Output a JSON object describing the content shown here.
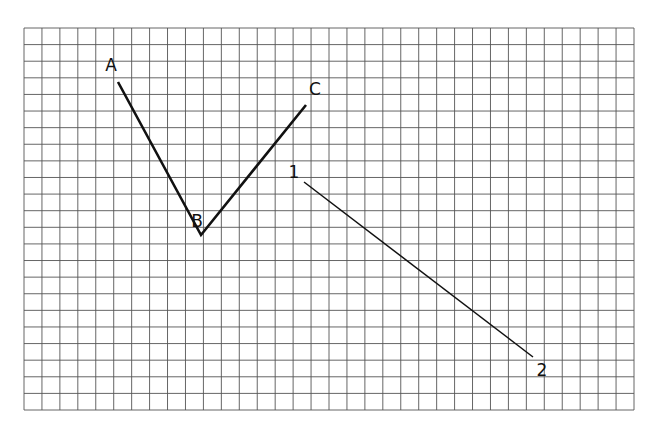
{
  "grid": {
    "x0": 24,
    "y0": 28,
    "x1": 634,
    "y1": 410,
    "cols": 34,
    "rows": 23,
    "line_color": "#555555",
    "background": "#ffffff"
  },
  "polylines": [
    {
      "id": "ABC",
      "points": [
        [
          118,
          82
        ],
        [
          201,
          235
        ],
        [
          306,
          105
        ]
      ],
      "stroke": "#111111",
      "width": 2.6
    },
    {
      "id": "12",
      "points": [
        [
          304,
          182
        ],
        [
          533,
          357
        ]
      ],
      "stroke": "#111111",
      "width": 1.5
    }
  ],
  "labels": [
    {
      "id": "A",
      "text": "A",
      "x": 111,
      "y": 71
    },
    {
      "id": "B",
      "text": "B",
      "x": 197,
      "y": 227
    },
    {
      "id": "C",
      "text": "C",
      "x": 315,
      "y": 95
    },
    {
      "id": "1",
      "text": "1",
      "x": 294,
      "y": 178
    },
    {
      "id": "2",
      "text": "2",
      "x": 542,
      "y": 376
    }
  ]
}
